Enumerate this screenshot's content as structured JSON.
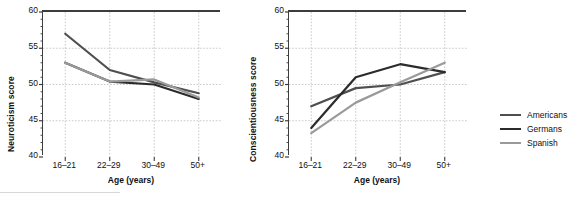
{
  "figure": {
    "background": "#ffffff",
    "legend": {
      "position": "right",
      "entries": [
        {
          "label": "Americans",
          "color": "#4f4f4f"
        },
        {
          "label": "Germans",
          "color": "#2b2b2b"
        },
        {
          "label": "Spanish",
          "color": "#9a9a9a"
        }
      ]
    }
  },
  "chart_data": [
    {
      "type": "line",
      "title": "",
      "xlabel": "Age (years)",
      "ylabel": "Neuroticism score",
      "categories": [
        "16–21",
        "22–29",
        "30–49",
        "50+"
      ],
      "yticks": [
        40,
        45,
        50,
        55,
        60
      ],
      "ytick_labels": [
        "40",
        "45",
        "50",
        "55",
        "60"
      ],
      "ylim": [
        40,
        60
      ],
      "grid": "dotted-xy",
      "series": [
        {
          "name": "Americans",
          "color": "#4f4f4f",
          "values": [
            57.0,
            52.0,
            50.3,
            48.8
          ]
        },
        {
          "name": "Germans",
          "color": "#2b2b2b",
          "values": [
            53.0,
            50.4,
            50.0,
            48.0
          ]
        },
        {
          "name": "Spanish",
          "color": "#9a9a9a",
          "values": [
            53.0,
            50.4,
            50.7,
            48.2
          ]
        }
      ]
    },
    {
      "type": "line",
      "title": "",
      "xlabel": "Age (years)",
      "ylabel": "Conscientiousness score",
      "categories": [
        "16–21",
        "22–29",
        "30–49",
        "50+"
      ],
      "yticks": [
        40,
        45,
        50,
        55,
        60
      ],
      "ytick_labels": [
        "40",
        "45",
        "50",
        "55",
        "60"
      ],
      "ylim": [
        40,
        60
      ],
      "grid": "dotted-xy",
      "series": [
        {
          "name": "Americans",
          "color": "#4f4f4f",
          "values": [
            47.0,
            49.5,
            50.0,
            51.7
          ]
        },
        {
          "name": "Germans",
          "color": "#2b2b2b",
          "values": [
            44.0,
            51.0,
            52.8,
            51.7
          ]
        },
        {
          "name": "Spanish",
          "color": "#9a9a9a",
          "values": [
            43.3,
            47.5,
            50.3,
            53.0
          ]
        }
      ]
    }
  ]
}
